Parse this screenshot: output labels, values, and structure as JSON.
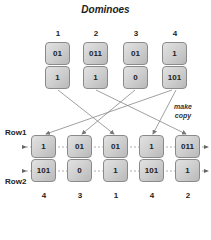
{
  "title": "Dominoes",
  "top_dominoes": [
    {
      "label": "1",
      "top": "01",
      "bottom": "1"
    },
    {
      "label": "2",
      "top": "011",
      "bottom": "1"
    },
    {
      "label": "3",
      "top": "01",
      "bottom": "0"
    },
    {
      "label": "4",
      "top": "1",
      "bottom": "101"
    }
  ],
  "bottom_dominoes": [
    {
      "label": "4",
      "top": "1",
      "bottom": "101"
    },
    {
      "label": "3",
      "top": "01",
      "bottom": "0"
    },
    {
      "label": "1",
      "top": "01",
      "bottom": "1"
    },
    {
      "label": "4",
      "top": "1",
      "bottom": "101"
    },
    {
      "label": "2",
      "top": "011",
      "bottom": "1"
    }
  ],
  "row_labels": {
    "row1": "Row1",
    "row2": "Row2"
  },
  "annotation": {
    "line1": "make",
    "line2": "copy"
  },
  "connections": [
    {
      "from": 1,
      "to": 3
    },
    {
      "from": 2,
      "to": 5
    },
    {
      "from": 3,
      "to": 2
    },
    {
      "from": 4,
      "to": 1
    },
    {
      "from": 4,
      "to": 4
    }
  ]
}
